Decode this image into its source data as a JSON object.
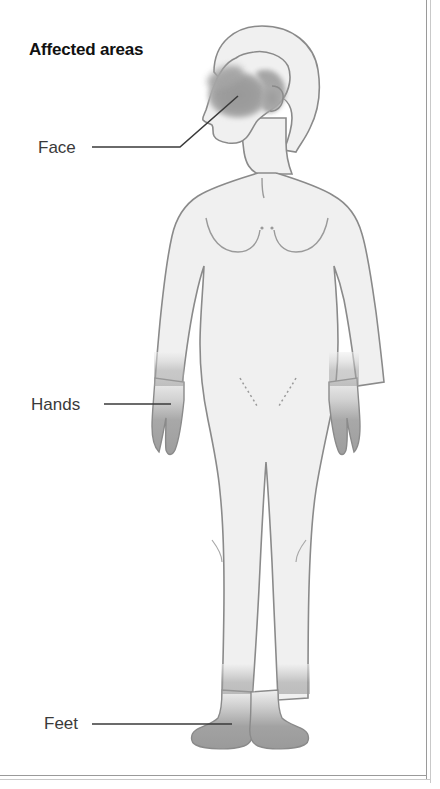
{
  "page": {
    "title": "Affected areas",
    "background_color": "#ffffff",
    "border_color": "#9a9a9a"
  },
  "illustration": {
    "name": "human-body-front-view-female",
    "body_fill": "#f0f0f0",
    "body_outline": "#8a8a8a",
    "affected_shade": "#9e9e9e",
    "leader_line_color": "#3a3a3a"
  },
  "callouts": [
    {
      "id": "face",
      "label": "Face",
      "region": "face-cheek",
      "leader": "horizontal-then-diagonal-up-right"
    },
    {
      "id": "hands",
      "label": "Hands",
      "region": "left-hand",
      "leader": "horizontal"
    },
    {
      "id": "feet",
      "label": "Feet",
      "region": "left-foot",
      "leader": "horizontal"
    }
  ],
  "labels": {
    "face": "Face",
    "hands": "Hands",
    "feet": "Feet"
  }
}
